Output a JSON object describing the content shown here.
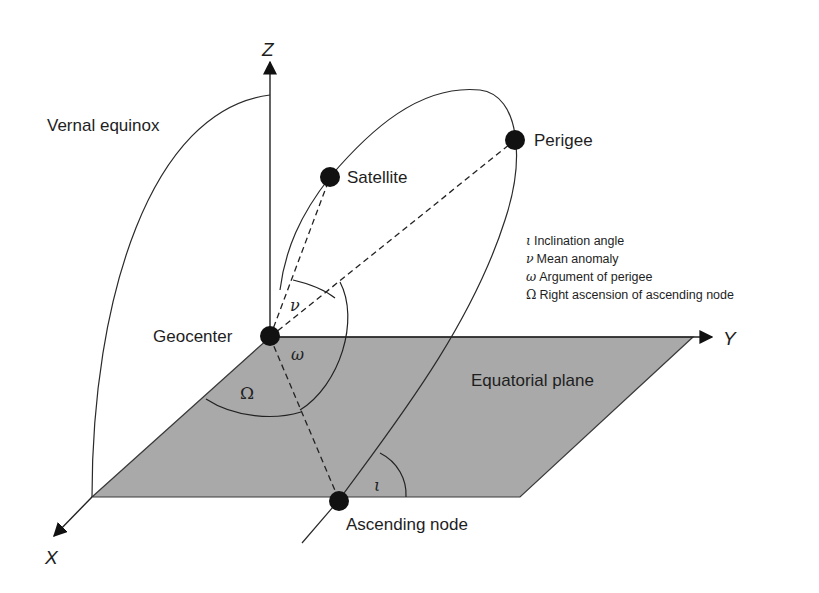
{
  "diagram": {
    "type": "orbital-elements",
    "axes": {
      "x_label": "X",
      "y_label": "Y",
      "z_label": "Z"
    },
    "labels": {
      "vernal_equinox": "Vernal equinox",
      "satellite": "Satellite",
      "perigee": "Perigee",
      "geocenter": "Geocenter",
      "equatorial_plane": "Equatorial plane",
      "ascending_node": "Ascending node"
    },
    "angle_symbols": {
      "nu": "ν",
      "omega": "ω",
      "Omega": "Ω",
      "iota": "ι"
    },
    "legend": [
      {
        "symbol": "ι",
        "text": "Inclination angle"
      },
      {
        "symbol": "ν",
        "text": "Mean anomaly"
      },
      {
        "symbol": "ω",
        "text": "Argument of perigee"
      },
      {
        "symbol": "Ω",
        "text": "Right ascension of ascending node"
      }
    ],
    "colors": {
      "plane_fill": "#a9a9a9",
      "line": "#2a2a2a",
      "points": "#111111",
      "background": "#ffffff"
    }
  }
}
